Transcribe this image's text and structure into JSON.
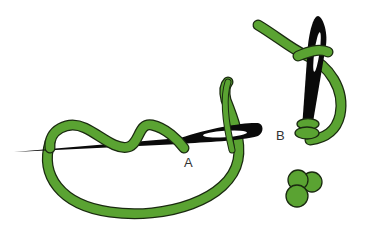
{
  "diagram": {
    "labels": {
      "a": "A",
      "b": "B"
    },
    "colors": {
      "thread": "#5aa332",
      "thread_outline": "#1a2a10",
      "needle": "#0a0a0a",
      "background": "#ffffff"
    },
    "steps": [
      {
        "id": "step-1",
        "description": "Needle with thread wrapped around it, thread emerging at A"
      },
      {
        "id": "step-2",
        "description": "Needle inserted at B with wraps pulled down"
      },
      {
        "id": "step-3",
        "description": "Finished cluster of knots"
      }
    ]
  }
}
